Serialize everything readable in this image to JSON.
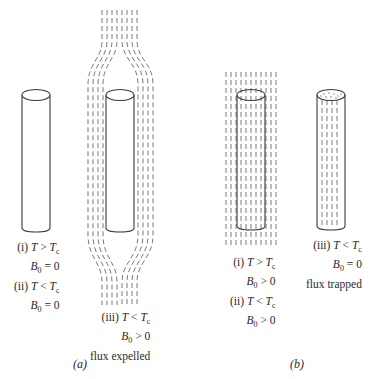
{
  "figure": {
    "type": "physics diagram",
    "panels": [
      {
        "id": "a",
        "tag": "(a)",
        "cases": [
          {
            "id": "a-i-ii",
            "lines": [
              {
                "prefix": "(i) ",
                "var": "T",
                "op": " > ",
                "rhs": "T",
                "sub": "c"
              },
              {
                "prefix": "",
                "var": "B",
                "varsub": "0",
                "op": " = ",
                "rhs": "0",
                "sub": ""
              },
              {
                "prefix": "(ii) ",
                "var": "T",
                "op": " < ",
                "rhs": "T",
                "sub": "c"
              },
              {
                "prefix": "",
                "var": "B",
                "varsub": "0",
                "op": " = ",
                "rhs": "0",
                "sub": ""
              }
            ],
            "flux": "none"
          },
          {
            "id": "a-iii",
            "lines": [
              {
                "prefix": "(iii) ",
                "var": "T",
                "op": " < ",
                "rhs": "T",
                "sub": "c"
              },
              {
                "prefix": "",
                "var": "B",
                "varsub": "0",
                "op": " > ",
                "rhs": "0",
                "sub": ""
              },
              {
                "prefix": "",
                "text": "flux expelled"
              }
            ],
            "flux": "expelled"
          }
        ]
      },
      {
        "id": "b",
        "tag": "(b)",
        "cases": [
          {
            "id": "b-i-ii",
            "lines": [
              {
                "prefix": "(i) ",
                "var": "T",
                "op": " > ",
                "rhs": "T",
                "sub": "c"
              },
              {
                "prefix": "",
                "var": "B",
                "varsub": "0",
                "op": " > ",
                "rhs": "0",
                "sub": ""
              },
              {
                "prefix": "(ii) ",
                "var": "T",
                "op": " < ",
                "rhs": "T",
                "sub": "c"
              },
              {
                "prefix": "",
                "var": "B",
                "varsub": "0",
                "op": " > ",
                "rhs": "0",
                "sub": ""
              }
            ],
            "flux": "penetrating"
          },
          {
            "id": "b-iii",
            "lines": [
              {
                "prefix": "(iii) ",
                "var": "T",
                "op": " < ",
                "rhs": "T",
                "sub": "c"
              },
              {
                "prefix": "",
                "var": "B",
                "varsub": "0",
                "op": " = ",
                "rhs": "0",
                "sub": ""
              },
              {
                "prefix": "",
                "text": "flux trapped"
              }
            ],
            "flux": "trapped"
          }
        ]
      }
    ],
    "colors": {
      "line": "#3a3a3a",
      "flux": "#6a6a6a",
      "background": "#ffffff"
    }
  }
}
